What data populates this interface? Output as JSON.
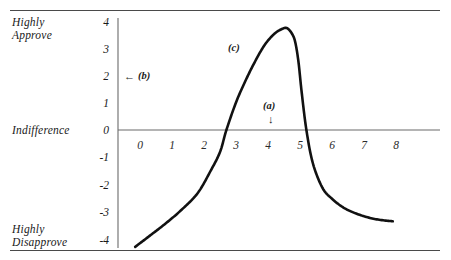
{
  "figure": {
    "background_color": "#ffffff",
    "rule_color": "#4a4a4a",
    "axis_color": "#6b6b6b",
    "curve_color": "#111111"
  },
  "chart_data": {
    "type": "line",
    "title": "",
    "subtitle": "",
    "xlabel": "",
    "ylabel": "",
    "grid": false,
    "legend_position": "none",
    "xlim": [
      -0.6,
      8.6
    ],
    "ylim": [
      -4.3,
      4.2
    ],
    "xticks": [
      "0",
      "1",
      "2",
      "3",
      "4",
      "5",
      "6",
      "7",
      "8"
    ],
    "xtick_values": [
      0,
      1,
      2,
      3,
      4,
      5,
      6,
      7,
      8
    ],
    "yticks": [
      "4",
      "3",
      "2",
      "1",
      "0",
      "-1",
      "-2",
      "-3",
      "-4"
    ],
    "ytick_values": [
      4,
      3,
      2,
      1,
      0,
      -1,
      -2,
      -3,
      -4
    ],
    "y_category_labels": [
      {
        "text_line1": "Highly",
        "text_line2": "Approve",
        "value": 4
      },
      {
        "text_line1": "Indifference",
        "text_line2": "",
        "value": 0
      },
      {
        "text_line1": "Highly",
        "text_line2": "Disapprove",
        "value": -4
      }
    ],
    "series": [
      {
        "name": "attitude-curve",
        "color": "#111111",
        "x": [
          -0.15,
          0.3,
          0.8,
          1.3,
          1.8,
          2.2,
          2.5,
          2.7,
          3.0,
          3.3,
          3.6,
          3.9,
          4.2,
          4.45,
          4.6,
          4.75,
          4.85,
          4.95,
          5.05,
          5.2,
          5.4,
          5.7,
          6.0,
          6.4,
          6.9,
          7.4,
          7.9
        ],
        "y": [
          -4.25,
          -3.85,
          -3.4,
          -2.9,
          -2.3,
          -1.5,
          -0.8,
          0.0,
          1.0,
          1.8,
          2.5,
          3.1,
          3.5,
          3.68,
          3.7,
          3.5,
          3.2,
          2.5,
          1.4,
          0.0,
          -1.2,
          -2.1,
          -2.5,
          -2.85,
          -3.1,
          -3.25,
          -3.32
        ]
      }
    ],
    "annotations": [
      {
        "id": "a",
        "label": "(a)",
        "arrow": "down",
        "x_value": 4.4,
        "y_value": 1.3
      },
      {
        "id": "b",
        "label": "(b)",
        "arrow": "left",
        "x_value": 0.5,
        "y_value": 2.0
      },
      {
        "id": "c",
        "label": "(c)",
        "arrow": "none",
        "x_value": 3.0,
        "y_value": 3.1
      }
    ]
  }
}
